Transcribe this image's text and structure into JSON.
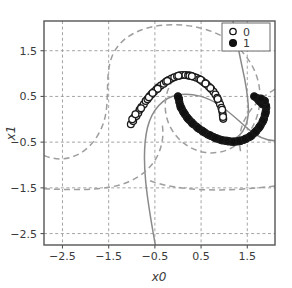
{
  "chart_data": {
    "type": "scatter",
    "title": "",
    "xlabel": "x0",
    "ylabel": "x1",
    "xlim": [
      -2.9,
      2.1
    ],
    "ylim": [
      -2.75,
      2.15
    ],
    "xticks": [
      -2.5,
      -1.5,
      -0.5,
      0.5,
      1.5
    ],
    "xticklabels": [
      "-2.5",
      "-1.5",
      "-0.5",
      "0.5",
      "1.5"
    ],
    "yticks": [
      1.5,
      0.5,
      -0.5,
      -1.5,
      -2.5
    ],
    "yticklabels": [
      "1.5",
      "0.5",
      "-0.5",
      "-1.5",
      "-2.5"
    ],
    "grid": true,
    "grid_style": "dashed",
    "legend_position": "upper right",
    "legend": [
      {
        "label": "0",
        "marker": "open-circle"
      },
      {
        "label": "1",
        "marker": "filled-circle"
      }
    ],
    "colors": {
      "marker_edge": "#1a1a1a",
      "marker_open_fill": "#ffffff",
      "marker_filled_fill": "#111111",
      "axis": "#555555",
      "grid": "#9a9a9a",
      "boundary_solid": "#8a8a8a",
      "boundary_dashed": "#9e9e9e",
      "text": "#3a3a3a"
    },
    "series": [
      {
        "name": "0",
        "marker": "open-circle",
        "points": [
          [
            -1.02,
            -0.11
          ],
          [
            -0.97,
            -0.04
          ],
          [
            -0.95,
            0.04
          ],
          [
            -0.9,
            0.07
          ],
          [
            -0.86,
            0.14
          ],
          [
            -0.83,
            0.21
          ],
          [
            -0.79,
            0.27
          ],
          [
            -0.74,
            0.33
          ],
          [
            -0.7,
            0.4
          ],
          [
            -0.66,
            0.44
          ],
          [
            -0.61,
            0.51
          ],
          [
            -0.57,
            0.55
          ],
          [
            -0.52,
            0.6
          ],
          [
            -0.47,
            0.65
          ],
          [
            -0.42,
            0.7
          ],
          [
            -0.37,
            0.74
          ],
          [
            -0.31,
            0.78
          ],
          [
            -0.26,
            0.82
          ],
          [
            -0.2,
            0.86
          ],
          [
            -0.14,
            0.89
          ],
          [
            -0.08,
            0.92
          ],
          [
            -0.02,
            0.94
          ],
          [
            0.04,
            0.96
          ],
          [
            0.1,
            0.97
          ],
          [
            0.16,
            0.97
          ],
          [
            0.22,
            0.96
          ],
          [
            0.28,
            0.95
          ],
          [
            0.34,
            0.93
          ],
          [
            0.4,
            0.91
          ],
          [
            0.46,
            0.88
          ],
          [
            0.52,
            0.84
          ],
          [
            0.57,
            0.8
          ],
          [
            0.62,
            0.76
          ],
          [
            0.67,
            0.71
          ],
          [
            0.72,
            0.66
          ],
          [
            0.77,
            0.6
          ],
          [
            0.81,
            0.54
          ],
          [
            0.85,
            0.47
          ],
          [
            0.88,
            0.4
          ],
          [
            0.91,
            0.33
          ],
          [
            0.94,
            0.25
          ],
          [
            0.96,
            0.17
          ],
          [
            0.97,
            0.09
          ],
          [
            0.98,
            0.01
          ],
          [
            -0.99,
            0.0
          ],
          [
            -0.92,
            0.11
          ],
          [
            -0.8,
            0.24
          ],
          [
            -0.63,
            0.48
          ],
          [
            -0.44,
            0.67
          ],
          [
            -0.23,
            0.84
          ],
          [
            0.01,
            0.95
          ],
          [
            0.25,
            0.955
          ],
          [
            0.49,
            0.865
          ],
          [
            0.7,
            0.685
          ],
          [
            0.86,
            0.445
          ],
          [
            0.955,
            0.21
          ],
          [
            0.975,
            0.05
          ],
          [
            -0.55,
            0.575
          ],
          [
            0.3,
            0.94
          ],
          [
            0.595,
            0.785
          ]
        ]
      },
      {
        "name": "1",
        "marker": "filled-circle",
        "points": [
          [
            0.0,
            0.5
          ],
          [
            0.02,
            0.44
          ],
          [
            0.03,
            0.37
          ],
          [
            0.05,
            0.3
          ],
          [
            0.08,
            0.23
          ],
          [
            0.11,
            0.17
          ],
          [
            0.15,
            0.11
          ],
          [
            0.19,
            0.05
          ],
          [
            0.24,
            -0.01
          ],
          [
            0.29,
            -0.06
          ],
          [
            0.34,
            -0.11
          ],
          [
            0.4,
            -0.16
          ],
          [
            0.46,
            -0.21
          ],
          [
            0.52,
            -0.25
          ],
          [
            0.58,
            -0.29
          ],
          [
            0.64,
            -0.33
          ],
          [
            0.71,
            -0.36
          ],
          [
            0.77,
            -0.39
          ],
          [
            0.84,
            -0.42
          ],
          [
            0.9,
            -0.44
          ],
          [
            0.97,
            -0.46
          ],
          [
            1.03,
            -0.47
          ],
          [
            1.1,
            -0.48
          ],
          [
            1.16,
            -0.49
          ],
          [
            1.23,
            -0.49
          ],
          [
            1.29,
            -0.48
          ],
          [
            1.36,
            -0.47
          ],
          [
            1.42,
            -0.45
          ],
          [
            1.48,
            -0.42
          ],
          [
            1.54,
            -0.39
          ],
          [
            1.6,
            -0.35
          ],
          [
            1.65,
            -0.3
          ],
          [
            1.7,
            -0.25
          ],
          [
            1.75,
            -0.19
          ],
          [
            1.79,
            -0.13
          ],
          [
            1.83,
            -0.06
          ],
          [
            1.86,
            0.01
          ],
          [
            1.88,
            0.09
          ],
          [
            1.9,
            0.17
          ],
          [
            1.91,
            0.25
          ],
          [
            0.01,
            0.47
          ],
          [
            0.06,
            0.26
          ],
          [
            0.13,
            0.14
          ],
          [
            0.21,
            0.02
          ],
          [
            0.31,
            -0.09
          ],
          [
            0.43,
            -0.19
          ],
          [
            0.55,
            -0.27
          ],
          [
            0.68,
            -0.345
          ],
          [
            0.8,
            -0.405
          ],
          [
            0.94,
            -0.455
          ],
          [
            1.07,
            -0.475
          ],
          [
            1.2,
            -0.49
          ],
          [
            1.33,
            -0.475
          ],
          [
            1.45,
            -0.435
          ],
          [
            1.57,
            -0.37
          ],
          [
            1.68,
            -0.275
          ],
          [
            1.77,
            -0.16
          ],
          [
            1.845,
            -0.025
          ],
          [
            1.895,
            0.13
          ],
          [
            1.905,
            0.3
          ],
          [
            1.74,
            0.42
          ],
          [
            1.78,
            0.38
          ],
          [
            1.7,
            0.47
          ],
          [
            1.83,
            0.33
          ],
          [
            1.65,
            0.5
          ],
          [
            1.88,
            0.4
          ],
          [
            1.8,
            0.45
          ]
        ]
      }
    ],
    "boundaries": [
      {
        "name": "decision-boundary-solid",
        "style": "solid",
        "paths": [
          "M -0.49 -2.75 C -0.57 -2.30 -0.66 -1.80 -0.70 -1.35 C -0.74 -0.92 -0.74 -0.52 -0.66 -0.18 C -0.56 0.22 -0.32 0.47 -0.02 0.53 C 0.30 0.60 0.66 0.48 0.94 0.28 C 1.18 0.11 1.36 -0.08 1.53 -0.22 C 1.70 -0.37 1.88 -0.46 2.10 -0.47",
          "M 1.19 2.15 C 1.27 1.72 1.36 1.28 1.44 0.90 C 1.50 0.58 1.54 0.32 1.52 0.10 C 1.49 -0.18 1.36 -0.38 1.14 -0.47"
        ]
      },
      {
        "name": "decision-boundary-dashed",
        "style": "dashed",
        "paths": [
          "M -2.90 -0.79 C -2.62 -0.92 -2.30 -0.88 -2.05 -0.70 C -1.80 -0.52 -1.62 -0.22 -1.56 0.14 C -1.49 0.58 -1.58 1.06 -1.40 1.44 C -1.20 1.84 -0.76 2.02 -0.30 2.06 C 0.18 2.10 0.68 2.00 1.07 1.75 C 1.45 1.50 1.70 1.12 1.76 0.70 C 1.82 0.28 1.70 -0.12 1.45 -0.40 C 1.22 -0.66 0.88 -0.78 0.56 -0.72 C 0.24 -0.66 -0.04 -0.44 -0.18 -0.14 C -0.33 0.18 -0.30 0.56 -0.12 0.84",
          "M -2.90 -1.52 C -2.40 -1.54 -1.85 -1.56 -1.40 -1.47 C -1.00 -1.39 -0.68 -1.18 -0.50 -0.90 C -0.35 -0.66 -0.30 -0.38 -0.34 -0.12",
          "M 2.10 -1.46 C 1.60 -1.52 1.05 -1.56 0.55 -1.54 C 0.10 -1.52 -0.30 -1.46 -0.62 -1.34",
          "M 2.10 0.66 C 1.84 0.50 1.62 0.30 1.48 0.06 C 1.34 -0.18 1.30 -0.46 1.36 -0.72"
        ]
      }
    ]
  }
}
